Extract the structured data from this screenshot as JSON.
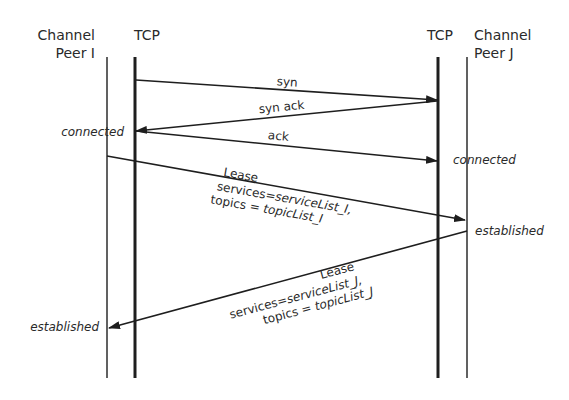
{
  "colors": {
    "line": "#1e1e1e",
    "text": "#2a2a2a",
    "background": "#ffffff"
  },
  "lifelines": {
    "peer_i": {
      "line1": "Channel",
      "line2": "Peer I"
    },
    "tcp_i": {
      "label": "TCP"
    },
    "tcp_j": {
      "label": "TCP"
    },
    "peer_j": {
      "line1": "Channel",
      "line2": "Peer J"
    }
  },
  "messages": {
    "syn": {
      "label": "syn"
    },
    "syn_ack": {
      "label": "syn ack"
    },
    "ack": {
      "label": "ack"
    },
    "lease_i": {
      "title": "Lease",
      "services_prefix": "services=",
      "services_value": "serviceList_I,",
      "topics_prefix": "topics = ",
      "topics_value": "topicList_I"
    },
    "lease_j": {
      "title": "Lease",
      "services_prefix": "services=",
      "services_value": "serviceList_J,",
      "topics_prefix": "topics = ",
      "topics_value": "topicList_J"
    }
  },
  "states": {
    "peer_i_connected": "connected",
    "peer_j_connected": "connected",
    "peer_j_established": "established",
    "peer_i_established": "established"
  }
}
